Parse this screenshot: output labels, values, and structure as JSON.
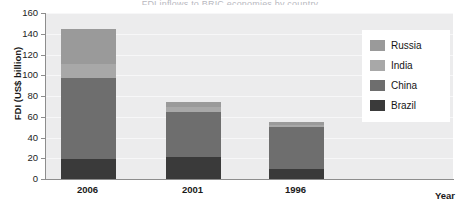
{
  "title_sliver": "FDI inflows to BRIC economies by country",
  "axes": {
    "ylabel": "FDI (US$ billion)",
    "xlabel": "Year",
    "yticks": [
      0,
      20,
      40,
      60,
      80,
      100,
      120,
      140,
      160
    ],
    "xticks": [
      "2006",
      "2001",
      "1996"
    ]
  },
  "legend": {
    "items": [
      {
        "label": "Russia",
        "color": "#9a9a9a"
      },
      {
        "label": "India",
        "color": "#a8a8a8"
      },
      {
        "label": "China",
        "color": "#6e6e6e"
      },
      {
        "label": "Brazil",
        "color": "#3a3a3a"
      }
    ]
  },
  "chart_data": {
    "type": "bar",
    "stacked": true,
    "title": "FDI inflows to BRIC economies by country",
    "xlabel": "Year",
    "ylabel": "FDI (US$ billion)",
    "ylim": [
      0,
      160
    ],
    "ytick_step": 20,
    "grid": true,
    "legend_position": "upper right",
    "categories": [
      "2006",
      "2001",
      "1996"
    ],
    "series": [
      {
        "name": "Brazil",
        "color": "#3a3a3a",
        "values": [
          19,
          21,
          10
        ]
      },
      {
        "name": "China",
        "color": "#6e6e6e",
        "values": [
          78,
          44,
          40
        ]
      },
      {
        "name": "India",
        "color": "#a8a8a8",
        "values": [
          14,
          4,
          2.5
        ]
      },
      {
        "name": "Russia",
        "color": "#9a9a9a",
        "values": [
          34,
          5,
          2.5
        ]
      }
    ],
    "totals": [
      145,
      74,
      55
    ]
  }
}
